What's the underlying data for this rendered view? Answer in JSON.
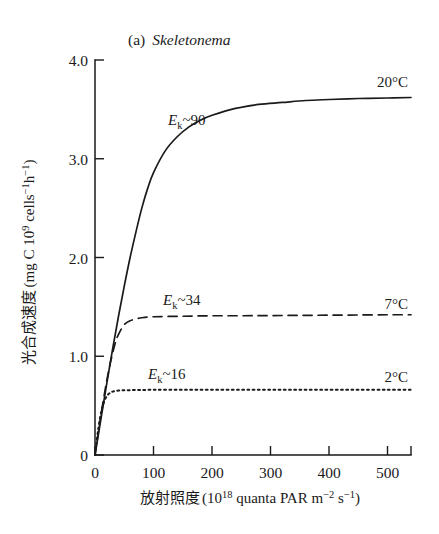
{
  "chart_data": {
    "type": "line",
    "title_parts": {
      "enumerator": "(a)",
      "species": "Skeletonema"
    },
    "xlabel": "放射照度 (10¹⁸ quanta PAR m⁻² s⁻¹)",
    "xlabel_parts": {
      "name": "放射照度",
      "open": "(",
      "base": "10",
      "exp": "18",
      "unit": " quanta PAR m",
      "unit_exp1": "−2",
      "unit_mid": " s",
      "unit_exp2": "−1",
      "close": ")"
    },
    "ylabel": "光合成速度 (mg C 10⁹ cells⁻¹h⁻¹)",
    "ylabel_parts": {
      "name": "光合成速度",
      "open": "(",
      "unit_a": "mg C 10",
      "exp_a": "9",
      "unit_b": " cells",
      "exp_b": "−1",
      "unit_c": "h",
      "exp_c": "−1",
      "close": ")"
    },
    "xlim": [
      0,
      540
    ],
    "ylim": [
      0,
      4.0
    ],
    "xticks": [
      0,
      100,
      200,
      300,
      400,
      500
    ],
    "xtick_labels": [
      "0",
      "100",
      "200",
      "300",
      "400",
      "500"
    ],
    "yticks": [
      0,
      1.0,
      2.0,
      3.0,
      4.0
    ],
    "ytick_labels": [
      "0",
      "1.0",
      "2.0",
      "3.0",
      "4.0"
    ],
    "grid": false,
    "legend_position": "inline-right-of-curve",
    "series": [
      {
        "name": "20°C",
        "label": "20°C",
        "style": "solid",
        "ek_annotation": "Eₖ~90",
        "ek_value": 90,
        "pmax": 3.62,
        "x": [
          0,
          10,
          20,
          30,
          40,
          50,
          60,
          70,
          80,
          90,
          100,
          120,
          140,
          160,
          180,
          200,
          240,
          280,
          320,
          360,
          400,
          450,
          500,
          540
        ],
        "y": [
          0,
          0.36,
          0.72,
          1.07,
          1.4,
          1.71,
          2.0,
          2.26,
          2.5,
          2.7,
          2.86,
          3.08,
          3.22,
          3.32,
          3.39,
          3.44,
          3.51,
          3.55,
          3.57,
          3.59,
          3.6,
          3.61,
          3.615,
          3.62
        ]
      },
      {
        "name": "7°C",
        "label": "7°C",
        "style": "dashed",
        "ek_annotation": "Eₖ~34",
        "ek_value": 34,
        "pmax": 1.42,
        "x": [
          0,
          5,
          10,
          15,
          20,
          25,
          30,
          35,
          40,
          50,
          60,
          80,
          100,
          150,
          200,
          250,
          300,
          350,
          400,
          450,
          500,
          540
        ],
        "y": [
          0,
          0.2,
          0.4,
          0.58,
          0.75,
          0.9,
          1.03,
          1.14,
          1.22,
          1.32,
          1.36,
          1.39,
          1.4,
          1.405,
          1.41,
          1.41,
          1.412,
          1.414,
          1.416,
          1.418,
          1.42,
          1.42
        ]
      },
      {
        "name": "2°C",
        "label": "2°C",
        "style": "dotted",
        "ek_annotation": "Eₖ~16",
        "ek_value": 16,
        "pmax": 0.66,
        "x": [
          0,
          3,
          6,
          9,
          12,
          15,
          18,
          22,
          26,
          30,
          40,
          60,
          100,
          150,
          200,
          250,
          300,
          350,
          400,
          450,
          500,
          540
        ],
        "y": [
          0,
          0.15,
          0.28,
          0.39,
          0.47,
          0.53,
          0.575,
          0.61,
          0.63,
          0.642,
          0.652,
          0.657,
          0.66,
          0.66,
          0.66,
          0.66,
          0.66,
          0.66,
          0.66,
          0.66,
          0.66,
          0.66
        ]
      }
    ],
    "annotations": [
      {
        "text": "Eₖ~90",
        "ek_e": "E",
        "ek_k": "k",
        "ek_rest": "~90",
        "series": "20°C"
      },
      {
        "text": "Eₖ~34",
        "ek_e": "E",
        "ek_k": "k",
        "ek_rest": "~34",
        "series": "7°C"
      },
      {
        "text": "Eₖ~16",
        "ek_e": "E",
        "ek_k": "k",
        "ek_rest": "~16",
        "series": "2°C"
      }
    ],
    "colors": {
      "ink": "#1a1a1a",
      "background": "#ffffff"
    }
  }
}
